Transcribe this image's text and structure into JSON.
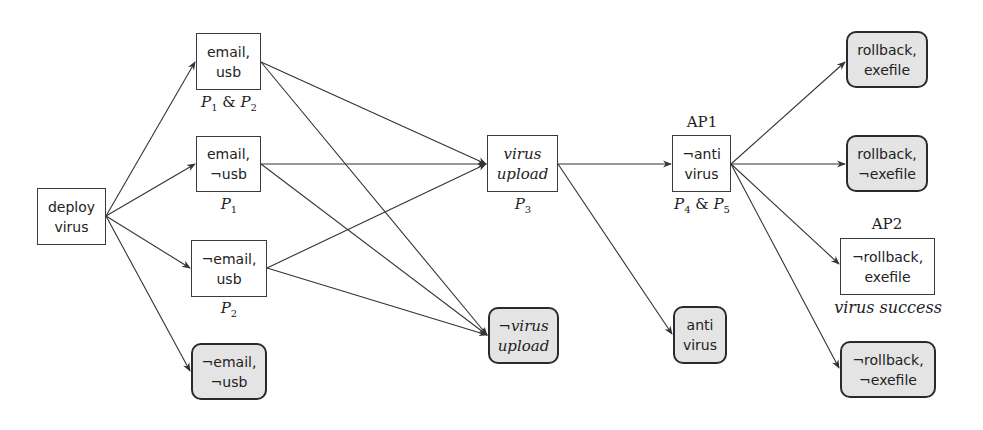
{
  "diagram": {
    "title": "",
    "nodes": {
      "deploy_virus": {
        "line1": "deploy",
        "line2": "virus",
        "terminal": false
      },
      "email_usb": {
        "line1": "email,",
        "line2": "usb",
        "terminal": false
      },
      "email_not_usb": {
        "line1": "email,",
        "line2": "¬usb",
        "terminal": false
      },
      "not_email_usb": {
        "line1": "¬email,",
        "line2": "usb",
        "terminal": false
      },
      "not_email_not_usb": {
        "line1": "¬email,",
        "line2": "¬usb",
        "terminal": true
      },
      "virus_upload": {
        "line1": "virus",
        "line2": "upload",
        "terminal": false
      },
      "not_virus_upload": {
        "line1": "¬virus",
        "line2": "upload",
        "terminal": true
      },
      "not_anti_virus": {
        "line1": "¬anti",
        "line2": "virus",
        "terminal": false
      },
      "anti_virus": {
        "line1": "anti",
        "line2": "virus",
        "terminal": true
      },
      "rollback_exefile": {
        "line1": "rollback,",
        "line2": "exefile",
        "terminal": true
      },
      "rollback_not_exefile": {
        "line1": "rollback,",
        "line2": "¬exefile",
        "terminal": true
      },
      "not_rollback_exefile": {
        "line1": "¬rollback,",
        "line2": "exefile",
        "terminal": false
      },
      "not_rollback_not_exefile": {
        "line1": "¬rollback,",
        "line2": "¬exefile",
        "terminal": true
      }
    },
    "labels": {
      "email_usb": {
        "a": "P",
        "a_sub": "1",
        "amp": " & ",
        "b": "P",
        "b_sub": "2"
      },
      "email_not_usb": {
        "a": "P",
        "a_sub": "1"
      },
      "not_email_usb": {
        "a": "P",
        "a_sub": "2"
      },
      "virus_upload": {
        "a": "P",
        "a_sub": "3"
      },
      "not_anti_virus_below": {
        "a": "P",
        "a_sub": "4",
        "amp": " & ",
        "b": "P",
        "b_sub": "5"
      },
      "ap1": "AP1",
      "ap2": "AP2",
      "virus_success": "virus success"
    },
    "edges": [
      {
        "from": "deploy_virus",
        "to": "email_usb"
      },
      {
        "from": "deploy_virus",
        "to": "email_not_usb"
      },
      {
        "from": "deploy_virus",
        "to": "not_email_usb"
      },
      {
        "from": "deploy_virus",
        "to": "not_email_not_usb"
      },
      {
        "from": "email_usb",
        "to": "virus_upload"
      },
      {
        "from": "email_usb",
        "to": "not_virus_upload"
      },
      {
        "from": "email_not_usb",
        "to": "virus_upload"
      },
      {
        "from": "email_not_usb",
        "to": "not_virus_upload"
      },
      {
        "from": "not_email_usb",
        "to": "virus_upload"
      },
      {
        "from": "not_email_usb",
        "to": "not_virus_upload"
      },
      {
        "from": "virus_upload",
        "to": "not_anti_virus"
      },
      {
        "from": "virus_upload",
        "to": "anti_virus"
      },
      {
        "from": "not_anti_virus",
        "to": "rollback_exefile"
      },
      {
        "from": "not_anti_virus",
        "to": "rollback_not_exefile"
      },
      {
        "from": "not_anti_virus",
        "to": "not_rollback_exefile"
      },
      {
        "from": "not_anti_virus",
        "to": "not_rollback_not_exefile"
      }
    ],
    "colors": {
      "stroke": "#333333",
      "terminal_fill": "#e4e4e4",
      "node_fill": "#ffffff"
    }
  }
}
